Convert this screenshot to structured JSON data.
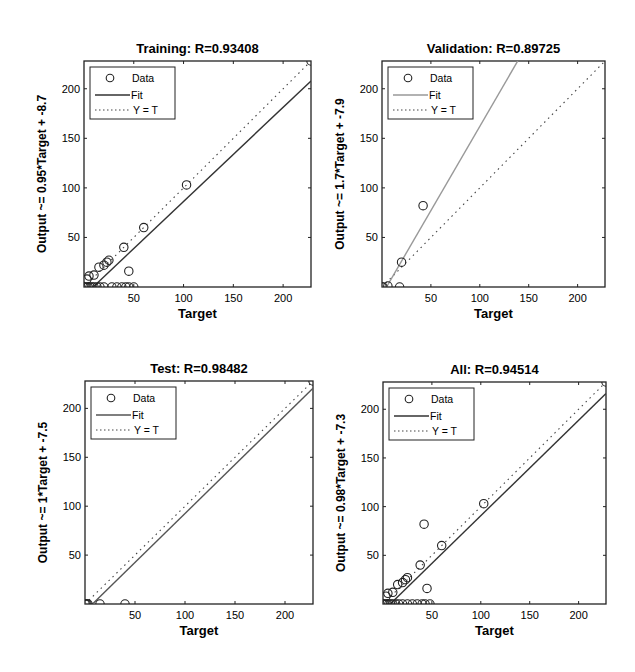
{
  "chart_data": [
    {
      "type": "scatter",
      "id": "training",
      "title": "Training: R=0.93408",
      "xlabel": "Target",
      "ylabel": "Output ~= 0.95*Target + -8.7",
      "xlim": [
        0,
        228
      ],
      "ylim": [
        0,
        228
      ],
      "xticks": [
        50,
        100,
        150,
        200
      ],
      "yticks": [
        50,
        100,
        150,
        200
      ],
      "grid": false,
      "legend": [
        "Data",
        "Fit",
        "Y = T"
      ],
      "legend_position": "upper left",
      "fit": {
        "slope": 0.95,
        "intercept": -8.7,
        "color": "#333333"
      },
      "points": [
        [
          228,
          228
        ],
        [
          103,
          103
        ],
        [
          60,
          60
        ],
        [
          40,
          40
        ],
        [
          45,
          16
        ],
        [
          25,
          27
        ],
        [
          23,
          25
        ],
        [
          20,
          22
        ],
        [
          15,
          20
        ],
        [
          10,
          12
        ],
        [
          5,
          11
        ],
        [
          3,
          8
        ],
        [
          0,
          0
        ],
        [
          2,
          0
        ],
        [
          4,
          0
        ],
        [
          6,
          0
        ],
        [
          8,
          0
        ],
        [
          10,
          0
        ],
        [
          13,
          0
        ],
        [
          16,
          0
        ],
        [
          20,
          0
        ],
        [
          28,
          0
        ],
        [
          33,
          0
        ],
        [
          38,
          0
        ],
        [
          42,
          0
        ],
        [
          45,
          0
        ],
        [
          50,
          0
        ]
      ]
    },
    {
      "type": "scatter",
      "id": "validation",
      "title": "Validation: R=0.89725",
      "xlabel": "Target",
      "ylabel": "Output ~= 1.7*Target + -7.9",
      "xlim": [
        0,
        228
      ],
      "ylim": [
        0,
        228
      ],
      "xticks": [
        50,
        100,
        150,
        200
      ],
      "yticks": [
        50,
        100,
        150,
        200
      ],
      "grid": false,
      "legend": [
        "Data",
        "Fit",
        "Y = T"
      ],
      "legend_position": "upper left",
      "fit": {
        "slope": 1.7,
        "intercept": -7.9,
        "color": "#999999"
      },
      "points": [
        [
          42,
          82
        ],
        [
          20,
          25
        ],
        [
          18,
          0
        ],
        [
          6,
          1
        ],
        [
          1,
          0
        ],
        [
          0,
          0
        ]
      ]
    },
    {
      "type": "scatter",
      "id": "test",
      "title": "Test: R=0.98482",
      "xlabel": "Target",
      "ylabel": "Output ~= 1*Target + -7.5",
      "xlim": [
        0,
        228
      ],
      "ylim": [
        0,
        228
      ],
      "xticks": [
        50,
        100,
        150,
        200
      ],
      "yticks": [
        50,
        100,
        150,
        200
      ],
      "grid": false,
      "legend": [
        "Data",
        "Fit",
        "Y = T"
      ],
      "legend_position": "upper left",
      "fit": {
        "slope": 1.0,
        "intercept": -7.5,
        "color": "#555555"
      },
      "points": [
        [
          228,
          228
        ],
        [
          40,
          0
        ],
        [
          15,
          0
        ],
        [
          3,
          0
        ],
        [
          2,
          0
        ],
        [
          1,
          0
        ],
        [
          0,
          0
        ]
      ]
    },
    {
      "type": "scatter",
      "id": "all",
      "title": "All: R=0.94514",
      "xlabel": "Target",
      "ylabel": "Output ~= 0.98*Target + -7.3",
      "xlim": [
        0,
        228
      ],
      "ylim": [
        0,
        228
      ],
      "xticks": [
        50,
        100,
        150,
        200
      ],
      "yticks": [
        50,
        100,
        150,
        200
      ],
      "grid": false,
      "legend": [
        "Data",
        "Fit",
        "Y = T"
      ],
      "legend_position": "upper left",
      "fit": {
        "slope": 0.98,
        "intercept": -7.3,
        "color": "#333333"
      },
      "points": [
        [
          228,
          228
        ],
        [
          103,
          103
        ],
        [
          60,
          60
        ],
        [
          42,
          82
        ],
        [
          38,
          40
        ],
        [
          45,
          16
        ],
        [
          25,
          27
        ],
        [
          23,
          25
        ],
        [
          20,
          22
        ],
        [
          15,
          20
        ],
        [
          10,
          12
        ],
        [
          5,
          11
        ],
        [
          3,
          8
        ],
        [
          0,
          0
        ],
        [
          2,
          0
        ],
        [
          4,
          0
        ],
        [
          6,
          0
        ],
        [
          8,
          0
        ],
        [
          10,
          0
        ],
        [
          13,
          0
        ],
        [
          16,
          0
        ],
        [
          20,
          0
        ],
        [
          25,
          0
        ],
        [
          30,
          0
        ],
        [
          35,
          0
        ],
        [
          40,
          0
        ],
        [
          43,
          0
        ],
        [
          48,
          0
        ]
      ]
    }
  ],
  "panels": [
    {
      "title": "Training: R=0.93408",
      "xlabel": "Target",
      "ylabel": "Output ~= 0.95*Target + -8.7",
      "legend": {
        "data": "Data",
        "fit": "Fit",
        "yt": "Y = T"
      },
      "ticks": [
        "50",
        "100",
        "150",
        "200"
      ]
    },
    {
      "title": "Validation: R=0.89725",
      "xlabel": "Target",
      "ylabel": "Output ~= 1.7*Target + -7.9",
      "legend": {
        "data": "Data",
        "fit": "Fit",
        "yt": "Y = T"
      },
      "ticks": [
        "50",
        "100",
        "150",
        "200"
      ]
    },
    {
      "title": "Test: R=0.98482",
      "xlabel": "Target",
      "ylabel": "Output ~= 1*Target + -7.5",
      "legend": {
        "data": "Data",
        "fit": "Fit",
        "yt": "Y = T"
      },
      "ticks": [
        "50",
        "100",
        "150",
        "200"
      ]
    },
    {
      "title": "All: R=0.94514",
      "xlabel": "Target",
      "ylabel": "Output ~= 0.98*Target + -7.3",
      "legend": {
        "data": "Data",
        "fit": "Fit",
        "yt": "Y = T"
      },
      "ticks": [
        "50",
        "100",
        "150",
        "200"
      ]
    }
  ]
}
